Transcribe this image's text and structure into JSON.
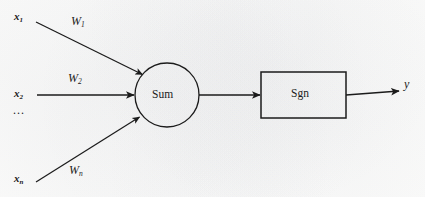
{
  "figure": {
    "background_color": "#fdfdfc",
    "stroke_color": "#1b1b1b",
    "text_color": "#1b1b1b"
  },
  "nodes": {
    "summation": {
      "label": "Sum",
      "shape": "circle",
      "cx": 167,
      "cy": 95,
      "r": 32
    },
    "activation": {
      "label": "Sgn",
      "shape": "rectangle",
      "x": 261,
      "y": 72,
      "width": 85,
      "height": 46
    }
  },
  "inputs": [
    {
      "name": "input-1",
      "label": "x",
      "subscript": "1",
      "weight_label": "W",
      "weight_subscript": "1"
    },
    {
      "name": "input-2",
      "label": "x",
      "subscript": "2",
      "weight_label": "W",
      "weight_subscript": "2"
    },
    {
      "name": "input-n",
      "label": "x",
      "subscript": "n",
      "weight_label": "W",
      "weight_subscript": "n"
    }
  ],
  "ellipsis": "...",
  "output": {
    "name": "output-y",
    "label": "y"
  },
  "edges": [
    {
      "name": "edge-x1-to-sum",
      "from": "input-1",
      "to": "summation",
      "style": "diagonal-down"
    },
    {
      "name": "edge-x2-to-sum",
      "from": "input-2",
      "to": "summation",
      "style": "horizontal"
    },
    {
      "name": "edge-xn-to-sum",
      "from": "input-n",
      "to": "summation",
      "style": "diagonal-up"
    },
    {
      "name": "edge-sum-to-sgn",
      "from": "summation",
      "to": "activation",
      "style": "horizontal"
    },
    {
      "name": "edge-sgn-to-output",
      "from": "activation",
      "to": "output",
      "style": "horizontal"
    }
  ]
}
